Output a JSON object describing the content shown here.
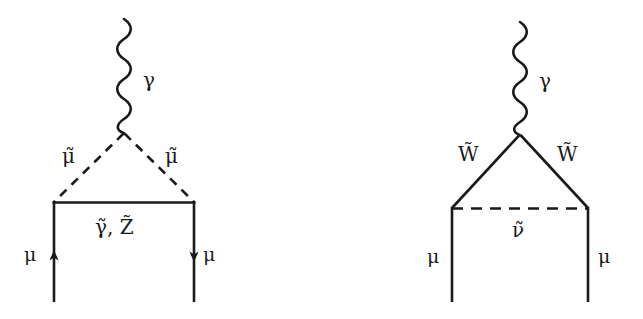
{
  "figure": {
    "type": "feynman-diagrams",
    "background_color": "#ffffff",
    "line_color": "#1a1a1a",
    "diagrams": [
      {
        "id": "smuon-neutralino-loop",
        "position": "left",
        "description": "Muon anomalous magnetic moment loop with smuon and neutralino",
        "labels": {
          "photon": "γ",
          "inner_left": "μ̃",
          "inner_right": "μ̃",
          "loop_bottom": "γ̃, Z̃",
          "leg_left": "μ",
          "leg_right": "μ"
        },
        "label_plain": {
          "photon": "gamma",
          "inner_left": "smuon",
          "inner_right": "smuon",
          "loop_bottom": "photino, zino",
          "leg_left": "muon",
          "leg_right": "muon"
        },
        "propagators": {
          "photon_line": "wavy",
          "inner_left_line": "dashed",
          "inner_right_line": "dashed",
          "loop_bottom_line": "solid",
          "leg_left_line": "solid-with-arrow-up",
          "leg_right_line": "solid-with-arrow-down"
        }
      },
      {
        "id": "wino-sneutrino-loop",
        "position": "right",
        "description": "Muon anomalous magnetic moment loop with wino and sneutrino",
        "labels": {
          "photon": "γ",
          "inner_left": "W̃",
          "inner_right": "W̃",
          "loop_bottom": "ν̃",
          "leg_left": "μ",
          "leg_right": "μ"
        },
        "label_plain": {
          "photon": "gamma",
          "inner_left": "wino",
          "inner_right": "wino",
          "loop_bottom": "sneutrino",
          "leg_left": "muon",
          "leg_right": "muon"
        },
        "propagators": {
          "photon_line": "wavy",
          "inner_left_line": "solid",
          "inner_right_line": "solid",
          "loop_bottom_line": "dashed",
          "leg_left_line": "solid",
          "leg_right_line": "solid"
        }
      }
    ]
  }
}
